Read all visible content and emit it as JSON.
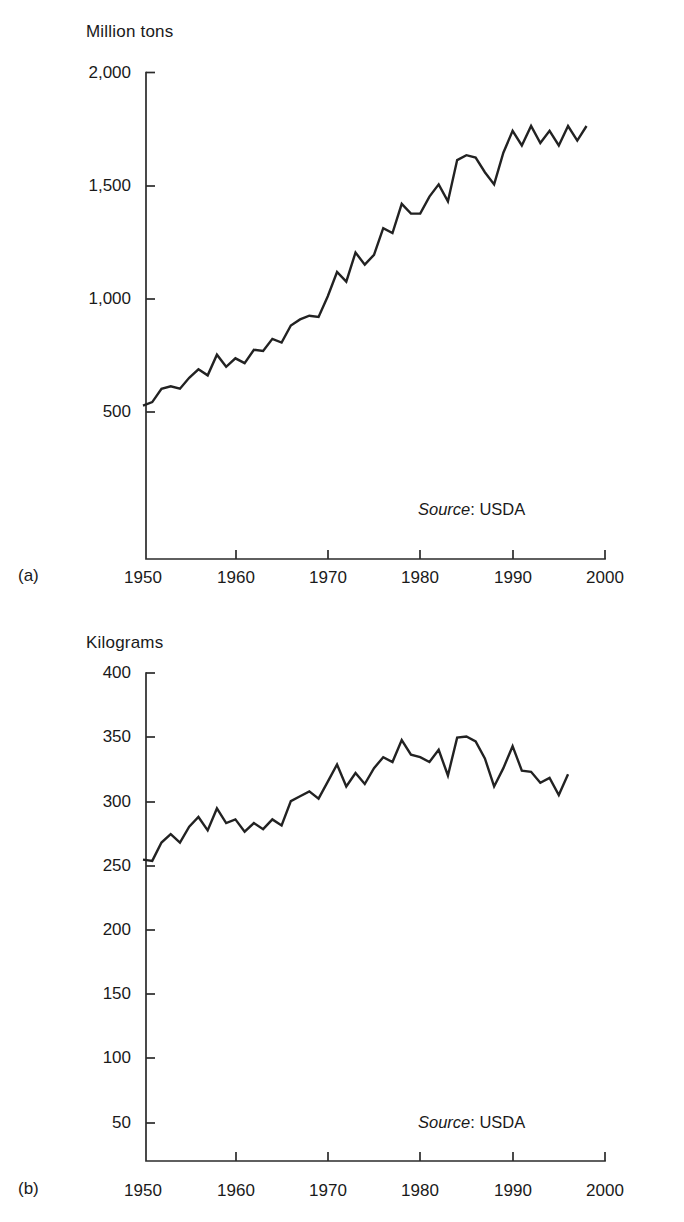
{
  "figures": [
    {
      "panel_letter": "(a)",
      "unit_label": "Million tons",
      "source": {
        "word": "Source",
        "value": ": USDA"
      },
      "y_ticks": [
        "2,000",
        "1,500",
        "1,000",
        "500"
      ],
      "x_ticks": [
        "1950",
        "1960",
        "1970",
        "1980",
        "1990",
        "2000"
      ]
    },
    {
      "panel_letter": "(b)",
      "unit_label": "Kilograms",
      "source": {
        "word": "Source",
        "value": ": USDA"
      },
      "y_ticks": [
        "400",
        "350",
        "300",
        "250",
        "200",
        "150",
        "100",
        "50"
      ],
      "x_ticks": [
        "1950",
        "1960",
        "1970",
        "1980",
        "1990",
        "2000"
      ]
    }
  ],
  "chart_data": [
    {
      "type": "line",
      "title": "",
      "panel": "(a)",
      "xlabel": "",
      "ylabel": "Million tons",
      "xlim": [
        1950,
        2000
      ],
      "ylim": [
        0,
        2000
      ],
      "yticks": [
        500,
        1000,
        1500,
        2000
      ],
      "xticks": [
        1950,
        1960,
        1970,
        1980,
        1990,
        2000
      ],
      "grid": false,
      "legend": "none",
      "annotations": [
        "Source: USDA"
      ],
      "x": [
        1950,
        1951,
        1952,
        1953,
        1954,
        1955,
        1956,
        1957,
        1958,
        1959,
        1960,
        1961,
        1962,
        1963,
        1964,
        1965,
        1966,
        1967,
        1968,
        1969,
        1970,
        1971,
        1972,
        1973,
        1974,
        1975,
        1976,
        1977,
        1978,
        1979,
        1980,
        1981,
        1982,
        1983,
        1984,
        1985,
        1986,
        1987,
        1988,
        1989,
        1990,
        1991,
        1992,
        1993,
        1994,
        1995,
        1996,
        1997,
        1998
      ],
      "values": [
        631,
        645,
        700,
        710,
        700,
        745,
        780,
        755,
        840,
        790,
        825,
        805,
        860,
        855,
        905,
        890,
        960,
        985,
        1000,
        995,
        1080,
        1180,
        1140,
        1260,
        1210,
        1250,
        1360,
        1340,
        1460,
        1420,
        1420,
        1490,
        1540,
        1470,
        1640,
        1660,
        1650,
        1590,
        1540,
        1670,
        1760,
        1700,
        1780,
        1710,
        1760,
        1700,
        1780,
        1720,
        1780
      ],
      "series_name": "World grain production"
    },
    {
      "type": "line",
      "title": "",
      "panel": "(b)",
      "xlabel": "",
      "ylabel": "Kilograms",
      "xlim": [
        1950,
        2000
      ],
      "ylim": [
        0,
        400
      ],
      "yticks": [
        50,
        100,
        150,
        200,
        250,
        300,
        350,
        400
      ],
      "xticks": [
        1950,
        1960,
        1970,
        1980,
        1990,
        2000
      ],
      "grid": false,
      "legend": "none",
      "annotations": [
        "Source: USDA"
      ],
      "x": [
        1950,
        1951,
        1952,
        1953,
        1954,
        1955,
        1956,
        1957,
        1958,
        1959,
        1960,
        1961,
        1962,
        1963,
        1964,
        1965,
        1966,
        1967,
        1968,
        1969,
        1970,
        1971,
        1972,
        1973,
        1974,
        1975,
        1976,
        1977,
        1978,
        1979,
        1980,
        1981,
        1982,
        1983,
        1984,
        1985,
        1986,
        1987,
        1988,
        1989,
        1990,
        1991,
        1992,
        1993,
        1994,
        1995,
        1996,
        1997
      ],
      "values": [
        247,
        246,
        261,
        268,
        261,
        274,
        282,
        271,
        289,
        277,
        280,
        270,
        277,
        272,
        280,
        275,
        295,
        299,
        303,
        297,
        311,
        325,
        307,
        318,
        309,
        322,
        331,
        327,
        345,
        333,
        331,
        327,
        337,
        316,
        347,
        348,
        344,
        330,
        307,
        322,
        340,
        320,
        319,
        310,
        314,
        300,
        317
      ],
      "series_name": "Grain production per person"
    }
  ]
}
